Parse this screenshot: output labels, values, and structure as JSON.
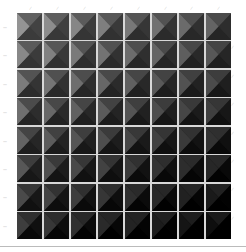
{
  "grid": {
    "rows": 8,
    "cols": 8,
    "tile_style": "pyramid-bevel",
    "brightness_start": 0.55,
    "brightness_end_col": 0.35,
    "brightness_end_row": 0.3
  },
  "column_labels": [
    "—",
    "—",
    "—",
    "—",
    "—",
    "—",
    "—",
    "—"
  ],
  "row_labels": [
    "—",
    "—",
    "—",
    "—",
    "—",
    "—",
    "—",
    "—"
  ],
  "right_labels": [
    "—",
    "—",
    "—",
    "—",
    "—",
    "—",
    "—"
  ],
  "colors": {
    "background": "#ffffff",
    "gap": "#d8d8d8",
    "label": "#999999"
  }
}
